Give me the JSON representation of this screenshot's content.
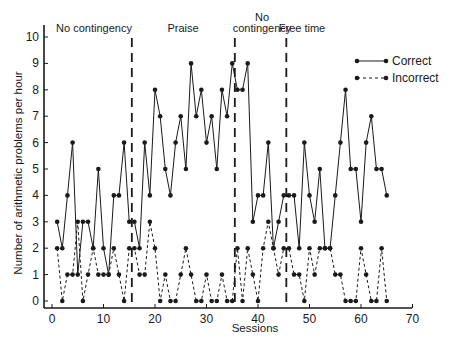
{
  "chart_data": {
    "type": "line",
    "title": "",
    "xlabel": "Sessions",
    "ylabel": "Number of arithmetic problems per hour",
    "xlim": [
      0,
      72
    ],
    "ylim": [
      0,
      10
    ],
    "xticks": [
      0,
      10,
      20,
      30,
      40,
      50,
      60,
      70
    ],
    "yticks": [
      0,
      1,
      2,
      3,
      4,
      5,
      6,
      7,
      8,
      9,
      10
    ],
    "grid": false,
    "legend_position": "upper right",
    "phases": [
      {
        "label": "No contingency",
        "start": 0,
        "end": 15.5
      },
      {
        "label": "Praise",
        "start": 15.5,
        "end": 35.5
      },
      {
        "label": "No contingency",
        "start": 35.5,
        "end": 45.5
      },
      {
        "label": "Free time",
        "start": 45.5,
        "end": 72
      }
    ],
    "phase_lines": [
      15.5,
      35.5,
      45.5
    ],
    "x": [
      1,
      2,
      3,
      4,
      5,
      6,
      7,
      8,
      9,
      10,
      11,
      12,
      13,
      14,
      15,
      16,
      17,
      18,
      19,
      20,
      21,
      22,
      23,
      24,
      25,
      26,
      27,
      28,
      29,
      30,
      31,
      32,
      33,
      34,
      35,
      36,
      37,
      38,
      39,
      40,
      41,
      42,
      43,
      44,
      45,
      46,
      47,
      48,
      49,
      50,
      51,
      52,
      53,
      54,
      55,
      56,
      57,
      58,
      59,
      60,
      61,
      62,
      63,
      64,
      65
    ],
    "series": [
      {
        "name": "Correct",
        "style": "solid",
        "values": [
          3,
          2,
          4,
          6,
          1,
          3,
          3,
          2,
          5,
          2,
          1,
          4,
          4,
          6,
          3,
          3,
          2,
          6,
          4,
          8,
          7,
          5,
          4,
          6,
          7,
          5,
          9,
          7,
          8,
          6,
          7,
          5,
          8,
          7,
          9,
          8,
          8,
          9,
          3,
          4,
          4,
          6,
          2,
          3,
          4,
          4,
          4,
          2,
          6,
          4,
          3,
          5,
          2,
          2,
          4,
          6,
          8,
          5,
          5,
          3,
          6,
          7,
          5,
          5,
          4
        ]
      },
      {
        "name": "Incorrect",
        "style": "dashed",
        "values": [
          2,
          0,
          1,
          1,
          3,
          0,
          1,
          2,
          1,
          1,
          1,
          2,
          1,
          0,
          2,
          2,
          1,
          1,
          3,
          2,
          0,
          1,
          0,
          0,
          1,
          2,
          1,
          0,
          0,
          1,
          0,
          0,
          1,
          0,
          0,
          2,
          0,
          2,
          1,
          0,
          2,
          3,
          2,
          1,
          2,
          2,
          1,
          1,
          0,
          2,
          1,
          2,
          2,
          2,
          1,
          1,
          0,
          0,
          0,
          2,
          1,
          0,
          0,
          2,
          0
        ]
      }
    ]
  },
  "legend": {
    "items": [
      {
        "label": "Correct",
        "style": "solid"
      },
      {
        "label": "Incorrect",
        "style": "dashed"
      }
    ]
  },
  "colors": {
    "line": "#1a1a1a",
    "background": "#ffffff"
  }
}
